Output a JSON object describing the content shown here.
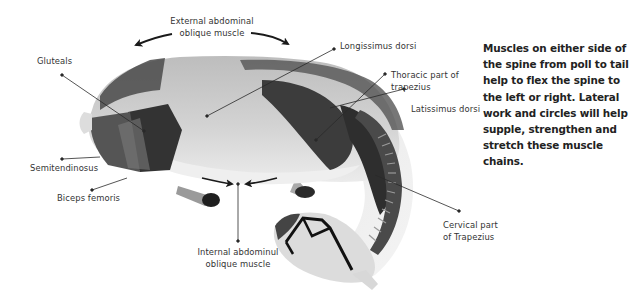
{
  "figure": {
    "labels": {
      "external_oblique": [
        "External abdominal",
        "oblique muscle"
      ],
      "longissimus": "Longissimus dorsi",
      "gluteals": "Gluteals",
      "thoracic_trapezius": [
        "Thoracic part of",
        "trapezius"
      ],
      "latissimus": "Latissimus dorsi",
      "semitendinosus": "Semitendinosus",
      "biceps_femoris": "Biceps femoris",
      "internal_oblique": [
        "Internal abdominul",
        "oblique muscle"
      ],
      "cervical_trapezius": [
        "Cervical part",
        "of Trapezius"
      ]
    }
  },
  "description": "Muscles on either side of the spine from poll to tail help to flex the spine to the left or right. Lateral work and circles will help supple, strengthen and stretch these muscle chains.",
  "colors": {
    "muscle_dark": "#3a3a3a",
    "muscle_mid": "#6e6e6e",
    "body_light": "#cfcfcf",
    "belly": "#e9e9e9",
    "leader_line": "#333333"
  }
}
